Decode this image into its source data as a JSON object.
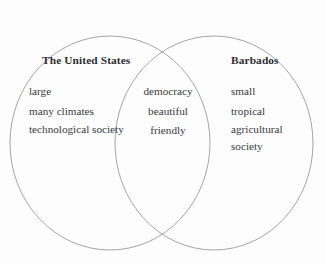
{
  "diagram": {
    "type": "venn",
    "title_left": "The United States",
    "title_right": "Barbados",
    "stroke_color": "#9a9a9e",
    "text_color": "#3a3a3e",
    "heading_color": "#2e2e32",
    "background_color": "#fdfdfd",
    "left_set": {
      "label": "The United States",
      "items": [
        "large",
        "many climates",
        "technological society"
      ]
    },
    "intersection_set": {
      "label": "",
      "items": [
        "democracy",
        "beautiful",
        "friendly"
      ]
    },
    "right_set": {
      "label": "Barbados",
      "items": [
        "small",
        "tropical",
        "agricultural society"
      ]
    }
  }
}
